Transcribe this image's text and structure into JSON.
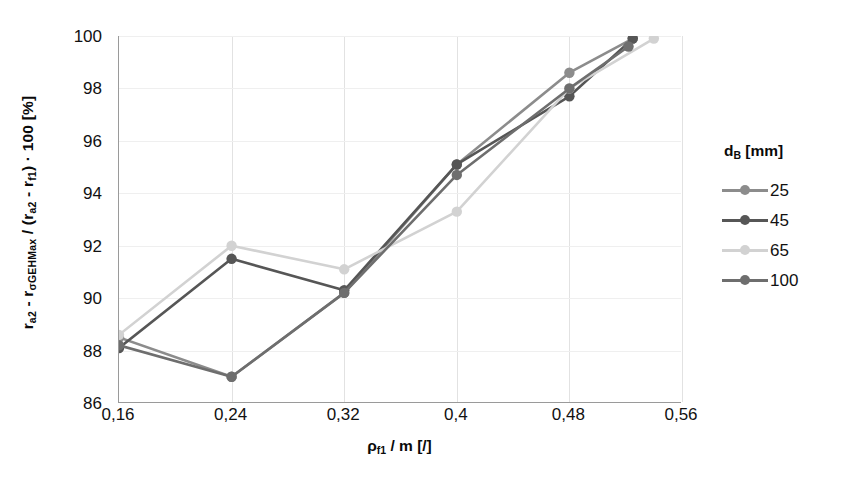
{
  "chart_data": {
    "type": "line",
    "title": "",
    "xlabel": "ρf1 / m [/]",
    "ylabel": "ra2 - rσGEHMax / (ra2 - rf1) · 100 [%]",
    "xlim": [
      0.16,
      0.56
    ],
    "ylim": [
      86,
      100
    ],
    "grid": true,
    "legend_position": "right",
    "legend_title": "dB [mm]",
    "x_tick_labels": [
      "0,16",
      "0,24",
      "0,32",
      "0,4",
      "0,48",
      "0,56"
    ],
    "x_ticks": [
      0.16,
      0.24,
      0.32,
      0.4,
      0.48,
      0.56
    ],
    "y_tick_labels": [
      "86",
      "88",
      "90",
      "92",
      "94",
      "96",
      "98",
      "100"
    ],
    "y_ticks": [
      86,
      88,
      90,
      92,
      94,
      96,
      98,
      100
    ],
    "series": [
      {
        "name": "25",
        "color": "#8c8c8c",
        "x": [
          0.16,
          0.24,
          0.32,
          0.4,
          0.48,
          0.525
        ],
        "values": [
          88.5,
          87.0,
          90.2,
          95.1,
          98.6,
          99.9
        ]
      },
      {
        "name": "45",
        "color": "#565656",
        "x": [
          0.16,
          0.24,
          0.32,
          0.4,
          0.48,
          0.525
        ],
        "values": [
          88.1,
          91.5,
          90.3,
          95.1,
          97.7,
          99.9
        ]
      },
      {
        "name": "65",
        "color": "#d2d2d2",
        "x": [
          0.16,
          0.24,
          0.32,
          0.4,
          0.48,
          0.54
        ],
        "values": [
          88.6,
          92.0,
          91.1,
          93.3,
          98.0,
          99.9
        ]
      },
      {
        "name": "100",
        "color": "#6e6e6e",
        "x": [
          0.16,
          0.24,
          0.32,
          0.4,
          0.48,
          0.522
        ],
        "values": [
          88.2,
          87.0,
          90.2,
          94.7,
          98.0,
          99.6
        ]
      }
    ]
  },
  "axes": {
    "ylabel_parts": {
      "p1": "r",
      "s1": "a2",
      "p2": " - r",
      "s2": "σGEHMax",
      "p3": " / (r",
      "s3": "a2",
      "p4": " - r",
      "s4": "f1",
      "p5": ") · 100 [%]"
    },
    "xlabel_parts": {
      "p1": "ρ",
      "s1": "f1",
      "p2": " / m [/]"
    }
  },
  "legend": {
    "title_parts": {
      "p1": "d",
      "s1": "B",
      "p2": " [mm]"
    },
    "items": [
      {
        "label": "25",
        "color": "#8c8c8c"
      },
      {
        "label": "45",
        "color": "#565656"
      },
      {
        "label": "65",
        "color": "#d2d2d2"
      },
      {
        "label": "100",
        "color": "#6e6e6e"
      }
    ]
  }
}
